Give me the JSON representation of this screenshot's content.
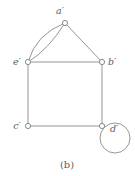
{
  "figure": {
    "caption": "(b)",
    "background_color": "#ffffff",
    "stroke_color": "#8a8a8a",
    "vertex_fill_color": "#ffffff",
    "label_color": "#5c5c5c",
    "vertices": [
      {
        "id": "a-prime",
        "label": "a′",
        "x": 65,
        "y": 23,
        "label_x": 60,
        "label_y": 14
      },
      {
        "id": "e-prime",
        "label": "e′",
        "x": 28,
        "y": 62,
        "label_x": 14,
        "label_y": 62
      },
      {
        "id": "b-prime",
        "label": "b′",
        "x": 102,
        "y": 62,
        "label_x": 108,
        "label_y": 62
      },
      {
        "id": "c-prime",
        "label": "c′",
        "x": 28,
        "y": 126,
        "label_x": 14,
        "label_y": 126
      },
      {
        "id": "d-prime",
        "label": "d′",
        "x": 102,
        "y": 126,
        "label_x": 110,
        "label_y": 130
      }
    ],
    "edges": [
      {
        "id": "edge-a-e-outer",
        "from": "a-prime",
        "to": "e-prime",
        "type": "curve",
        "note": "parallel edge, bulges left"
      },
      {
        "id": "edge-a-e-inner",
        "from": "a-prime",
        "to": "e-prime",
        "type": "curve",
        "note": "parallel edge, bulges right"
      },
      {
        "id": "edge-a-b",
        "from": "a-prime",
        "to": "b-prime",
        "type": "straight"
      },
      {
        "id": "edge-e-b",
        "from": "e-prime",
        "to": "b-prime",
        "type": "straight"
      },
      {
        "id": "edge-e-c",
        "from": "e-prime",
        "to": "c-prime",
        "type": "straight"
      },
      {
        "id": "edge-b-d",
        "from": "b-prime",
        "to": "d-prime",
        "type": "straight"
      },
      {
        "id": "edge-c-d",
        "from": "c-prime",
        "to": "d-prime",
        "type": "straight"
      },
      {
        "id": "edge-d-loop",
        "from": "d-prime",
        "to": "d-prime",
        "type": "self-loop",
        "cx": 115,
        "cy": 138,
        "r": 15
      }
    ],
    "caption_x": 67,
    "caption_y": 166
  }
}
